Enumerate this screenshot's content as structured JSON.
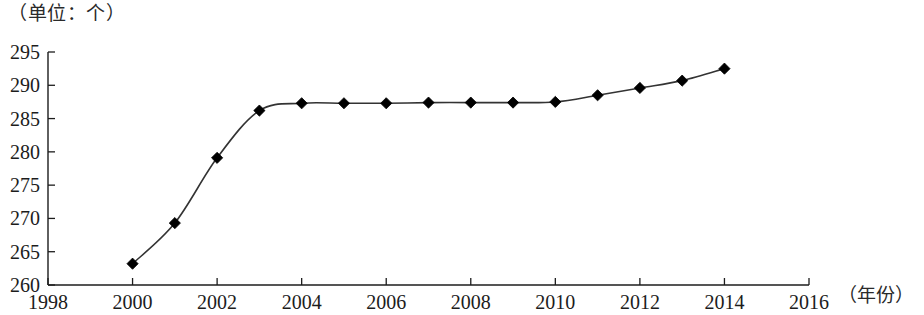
{
  "caption": {
    "unit_label": "（单位：个）",
    "x_axis_title": "（年份）"
  },
  "chart_data": {
    "type": "line",
    "title": "",
    "subtitle": "",
    "xlabel": "（年份）",
    "ylabel": "（单位：个）",
    "xlim": [
      1998,
      2016
    ],
    "ylim": [
      260,
      295
    ],
    "x_tick_labels": [
      "1998",
      "2000",
      "2002",
      "2004",
      "2006",
      "2008",
      "2010",
      "2012",
      "2014",
      "2016"
    ],
    "x_ticks": [
      1998,
      2000,
      2002,
      2004,
      2006,
      2008,
      2010,
      2012,
      2014,
      2016
    ],
    "y_tick_labels": [
      "260",
      "265",
      "270",
      "275",
      "280",
      "285",
      "290",
      "295"
    ],
    "y_ticks": [
      260,
      265,
      270,
      275,
      280,
      285,
      290,
      295
    ],
    "grid": false,
    "legend": "none",
    "marker": "diamond",
    "marker_color": "#000000",
    "line_color": "#333333",
    "x": [
      2000,
      2001,
      2002,
      2003,
      2004,
      2005,
      2006,
      2007,
      2008,
      2009,
      2010,
      2011,
      2012,
      2013,
      2014
    ],
    "values": [
      263.2,
      269.3,
      279.1,
      286.2,
      287.3,
      287.3,
      287.3,
      287.4,
      287.4,
      287.4,
      287.5,
      288.5,
      289.6,
      290.7,
      292.5
    ],
    "series": [
      {
        "name": "数量",
        "x": [
          2000,
          2001,
          2002,
          2003,
          2004,
          2005,
          2006,
          2007,
          2008,
          2009,
          2010,
          2011,
          2012,
          2013,
          2014
        ],
        "values": [
          263.2,
          269.3,
          279.1,
          286.2,
          287.3,
          287.3,
          287.3,
          287.4,
          287.4,
          287.4,
          287.5,
          288.5,
          289.6,
          290.7,
          292.5
        ]
      }
    ]
  }
}
